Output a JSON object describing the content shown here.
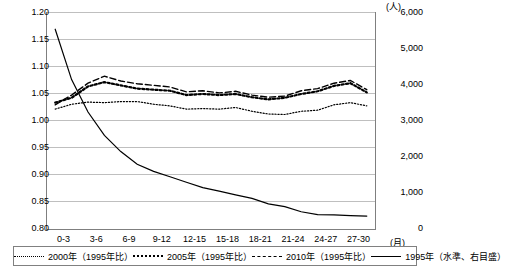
{
  "chart_data": {
    "type": "line",
    "title": "",
    "xlabel": "",
    "ylabel": "",
    "grid": true,
    "legend_position": "bottom",
    "categories": [
      "0-3",
      "3-6",
      "6-9",
      "9-12",
      "12-15",
      "15-18",
      "18-21",
      "21-24",
      "24-27",
      "27-30"
    ],
    "x_axis_unit": "(月)",
    "left_axis": {
      "ticks": [
        "0.80",
        "0.85",
        "0.90",
        "0.95",
        "1.00",
        "1.05",
        "1.10",
        "1.15",
        "1.20"
      ],
      "min": 0.8,
      "max": 1.2,
      "unit": ""
    },
    "right_axis": {
      "ticks": [
        "0",
        "1,000",
        "2,000",
        "3,000",
        "4,000",
        "5,000",
        "6,000"
      ],
      "min": 0,
      "max": 6000,
      "unit": "(人)"
    },
    "series": [
      {
        "name": "2000年（1995年比）",
        "style": "dotted",
        "axis": "left",
        "x": [
          0,
          1,
          2,
          3,
          4,
          5,
          6,
          7,
          8,
          9,
          10,
          11,
          12,
          13,
          14,
          15,
          16,
          17,
          18,
          19
        ],
        "values": [
          1.022,
          1.031,
          1.035,
          1.034,
          1.036,
          1.036,
          1.031,
          1.028,
          1.022,
          1.023,
          1.022,
          1.025,
          1.018,
          1.013,
          1.012,
          1.018,
          1.02,
          1.03,
          1.034,
          1.028
        ]
      },
      {
        "name": "2005年（1995年比）",
        "style": "dotted-thick",
        "axis": "left",
        "x": [
          0,
          1,
          2,
          3,
          4,
          5,
          6,
          7,
          8,
          9,
          10,
          11,
          12,
          13,
          14,
          15,
          16,
          17,
          18,
          19
        ],
        "values": [
          1.034,
          1.043,
          1.064,
          1.072,
          1.066,
          1.06,
          1.058,
          1.056,
          1.048,
          1.05,
          1.048,
          1.05,
          1.044,
          1.04,
          1.043,
          1.05,
          1.055,
          1.065,
          1.07,
          1.053
        ]
      },
      {
        "name": "2010年（1995年比）",
        "style": "dashed",
        "axis": "left",
        "x": [
          0,
          1,
          2,
          3,
          4,
          5,
          6,
          7,
          8,
          9,
          10,
          11,
          12,
          13,
          14,
          15,
          16,
          17,
          18,
          19
        ],
        "values": [
          1.03,
          1.048,
          1.07,
          1.083,
          1.074,
          1.069,
          1.066,
          1.063,
          1.054,
          1.056,
          1.052,
          1.055,
          1.048,
          1.044,
          1.046,
          1.056,
          1.06,
          1.07,
          1.075,
          1.058
        ]
      },
      {
        "name": "1995年（水準、右目盛）",
        "style": "solid",
        "axis": "right",
        "x": [
          0,
          1,
          2,
          3,
          4,
          5,
          6,
          7,
          8,
          9,
          10,
          11,
          12,
          13,
          14,
          15,
          16,
          17,
          18,
          19
        ],
        "values": [
          5550,
          4150,
          3250,
          2600,
          2150,
          1800,
          1600,
          1450,
          1300,
          1150,
          1050,
          950,
          850,
          700,
          620,
          480,
          400,
          390,
          370,
          360
        ]
      }
    ]
  },
  "legend": {
    "items": [
      {
        "label": "2000年（1995年比）"
      },
      {
        "label": "2005年（1995年比）"
      },
      {
        "label": "2010年（1995年比）"
      },
      {
        "label": "1995年（水準、右目盛）"
      }
    ]
  }
}
